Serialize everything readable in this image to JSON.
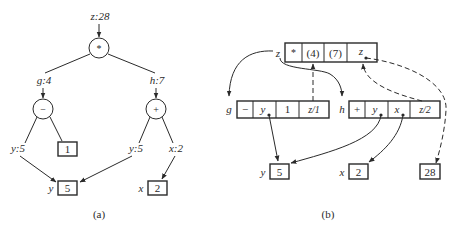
{
  "panel_a": {
    "caption": "(a)",
    "root": {
      "label": "z:28",
      "op": "*"
    },
    "left": {
      "label": "g:4",
      "op": "−",
      "child_label": "y:5",
      "const": "1"
    },
    "right": {
      "label": "h:7",
      "op": "+",
      "child_label_y": "y:5",
      "child_label_x": "x:2"
    },
    "leaves": [
      {
        "name": "y",
        "value": "5"
      },
      {
        "name": "x",
        "value": "2"
      }
    ]
  },
  "panel_b": {
    "caption": "(b)",
    "top_record": {
      "name": "z",
      "cells": [
        "*",
        "(4)",
        "(7)",
        "z"
      ]
    },
    "g_record": {
      "name": "g",
      "cells": [
        "−",
        "y",
        "1",
        "z/1"
      ]
    },
    "h_record": {
      "name": "h",
      "cells": [
        "+",
        "y",
        "x",
        "z/2"
      ]
    },
    "leaves": [
      {
        "name": "y",
        "value": "5"
      },
      {
        "name": "x",
        "value": "2"
      },
      {
        "name": "",
        "value": "28"
      }
    ]
  }
}
